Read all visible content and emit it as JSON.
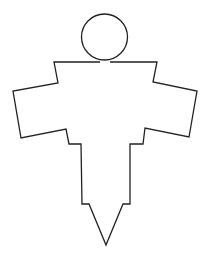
{
  "diagram": {
    "title": "",
    "stroke_color": "#222222",
    "fill_color": "#ffffff",
    "background": "#ffffff",
    "stroke_width": 1.3,
    "head": {
      "cx": 104.5,
      "cy": 37,
      "r": 23
    },
    "body_points": "100,62 54,62 58,83 13,91 21,138 66,129 69,144 81,144 82,204 89,204 106,245 123,204 130,204 130,144 143,144 145,128 189,137 197,91 153,82 157,62 110,62"
  }
}
